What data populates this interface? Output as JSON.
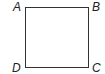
{
  "diagram": {
    "shape": "square",
    "vertices": [
      {
        "label": "A",
        "position": "top-left"
      },
      {
        "label": "B",
        "position": "top-right"
      },
      {
        "label": "C",
        "position": "bottom-right"
      },
      {
        "label": "D",
        "position": "bottom-left"
      }
    ],
    "stroke_color": "#333333",
    "background": "#ffffff"
  }
}
